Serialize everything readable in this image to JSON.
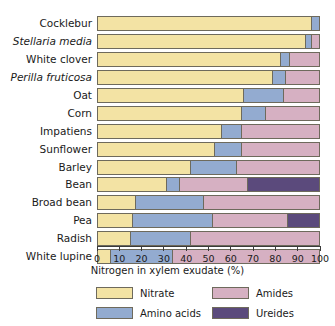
{
  "chart_data": {
    "type": "bar",
    "orientation": "horizontal",
    "stacked": true,
    "title": "",
    "xlabel": "Nitrogen in xylem exudate (%)",
    "ylabel": "",
    "xlim": [
      0,
      100
    ],
    "xticks": [
      0,
      10,
      20,
      30,
      40,
      50,
      60,
      70,
      80,
      90,
      100
    ],
    "xtick_labels": [
      "0",
      "10",
      "20",
      "30",
      "40",
      "50",
      "60",
      "70",
      "80",
      "90",
      "100"
    ],
    "grid": false,
    "legend_position": "bottom",
    "categories": [
      "Cocklebur",
      "Stellaria media",
      "White clover",
      "Perilla fruticosa",
      "Oat",
      "Corn",
      "Impatiens",
      "Sunflower",
      "Barley",
      "Bean",
      "Broad bean",
      "Pea",
      "Radish",
      "White lupine"
    ],
    "category_styles": [
      "normal",
      "italic",
      "normal",
      "italic",
      "normal",
      "normal",
      "normal",
      "normal",
      "normal",
      "normal",
      "normal",
      "normal",
      "normal",
      "normal"
    ],
    "series": [
      {
        "name": "Nitrate",
        "color": "#f3e3a4",
        "values": [
          97,
          94,
          83,
          79,
          66,
          65,
          56,
          53,
          42,
          31,
          17,
          16,
          15,
          6
        ]
      },
      {
        "name": "Amino acids",
        "color": "#93abd0",
        "values": [
          3,
          3,
          4,
          6,
          18,
          11,
          9,
          12,
          21,
          6,
          31,
          36,
          27,
          28
        ]
      },
      {
        "name": "Amides",
        "color": "#d6b0c2",
        "values": [
          0,
          3,
          13,
          15,
          16,
          24,
          35,
          35,
          37,
          31,
          52,
          34,
          58,
          66
        ]
      },
      {
        "name": "Ureides",
        "color": "#5b4a7c",
        "values": [
          0,
          0,
          0,
          0,
          0,
          0,
          0,
          0,
          0,
          32,
          0,
          14,
          0,
          0
        ]
      }
    ],
    "legend_entries": [
      {
        "label": "Nitrate",
        "color": "#f3e3a4",
        "key": "nitrate"
      },
      {
        "label": "Amides",
        "color": "#d6b0c2",
        "key": "amides"
      },
      {
        "label": "Amino acids",
        "color": "#93abd0",
        "key": "amino"
      },
      {
        "label": "Ureides",
        "color": "#5b4a7c",
        "key": "ureides"
      }
    ]
  }
}
